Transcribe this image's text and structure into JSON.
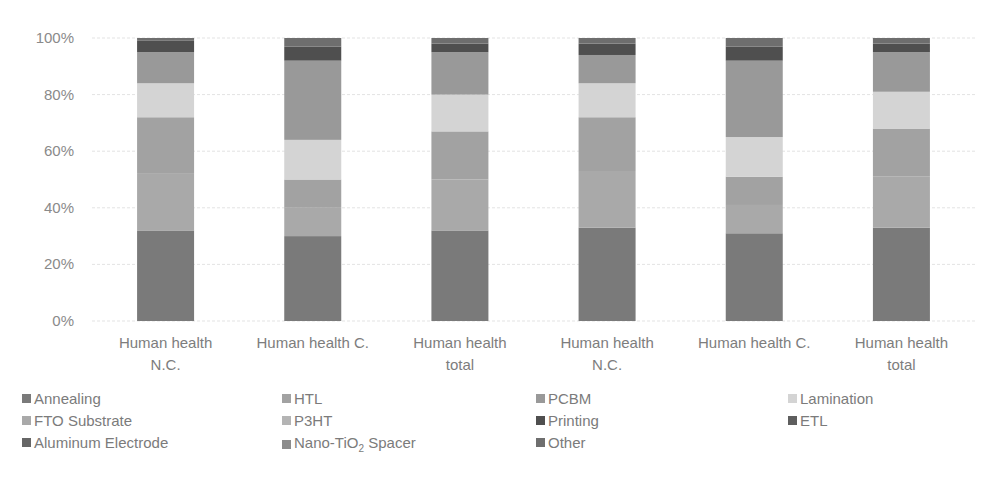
{
  "chart_data": {
    "type": "bar",
    "stacked": "percent",
    "title": "",
    "xlabel": "",
    "ylabel": "",
    "ylim": [
      0,
      100
    ],
    "yticks": [
      "0%",
      "20%",
      "40%",
      "60%",
      "80%",
      "100%"
    ],
    "grid": true,
    "legend_position": "bottom",
    "categories": [
      "Human health N.C.",
      "Human health C.",
      "Human health total",
      "Human health N.C.",
      "Human health C.",
      "Human health total"
    ],
    "category_lines": [
      [
        "Human health",
        "N.C."
      ],
      [
        "Human health C."
      ],
      [
        "Human health",
        "total"
      ],
      [
        "Human health",
        "N.C."
      ],
      [
        "Human health C."
      ],
      [
        "Human health",
        "total"
      ]
    ],
    "series": [
      {
        "name": "Annealing",
        "color": "#7a7a7a",
        "values": [
          32,
          30,
          32,
          33,
          31,
          33
        ]
      },
      {
        "name": "FTO Substrate",
        "color": "#a9a9a9",
        "values": [
          20,
          10,
          18,
          20,
          10,
          18
        ]
      },
      {
        "name": "HTL",
        "color": "#a2a2a2",
        "values": [
          20,
          10,
          17,
          19,
          10,
          17
        ]
      },
      {
        "name": "P3HT",
        "color": "#b4b4b4",
        "values": [
          0,
          0,
          0,
          0,
          0,
          0
        ]
      },
      {
        "name": "Lamination",
        "color": "#d4d4d4",
        "values": [
          12,
          14,
          13,
          12,
          14,
          13
        ]
      },
      {
        "name": "PCBM",
        "color": "#999999",
        "values": [
          11,
          28,
          15,
          10,
          27,
          14
        ]
      },
      {
        "name": "Nano-TiO2 Spacer",
        "color": "#8c8c8c",
        "values": [
          0,
          0,
          0,
          0,
          0,
          0
        ]
      },
      {
        "name": "Printing",
        "color": "#4f4f4f",
        "values": [
          4,
          5,
          3,
          4,
          5,
          3
        ]
      },
      {
        "name": "ETL",
        "color": "#5e5e5e",
        "values": [
          0,
          0,
          0,
          0,
          0,
          0
        ]
      },
      {
        "name": "Aluminum Electrode",
        "color": "#666666",
        "values": [
          0,
          0,
          0,
          0,
          0,
          0
        ]
      },
      {
        "name": "Other",
        "color": "#6e6e6e",
        "values": [
          1,
          3,
          2,
          2,
          3,
          2
        ]
      }
    ]
  },
  "legend": {
    "rows": [
      [
        {
          "label": "Annealing",
          "color": "#7a7a7a"
        },
        {
          "label": "HTL",
          "color": "#a2a2a2"
        },
        {
          "label": "PCBM",
          "color": "#999999"
        },
        {
          "label": "Lamination",
          "color": "#d4d4d4"
        }
      ],
      [
        {
          "label": "FTO Substrate",
          "color": "#a9a9a9"
        },
        {
          "label": "P3HT",
          "color": "#b4b4b4"
        },
        {
          "label": "Printing",
          "color": "#4f4f4f"
        },
        {
          "label": "ETL",
          "color": "#5e5e5e"
        }
      ],
      [
        {
          "label": "Aluminum Electrode",
          "color": "#666666"
        },
        {
          "label": "Nano-TiO",
          "sub": "2",
          "suffix": " Spacer",
          "color": "#8c8c8c"
        },
        {
          "label": "Other",
          "color": "#6e6e6e"
        }
      ]
    ]
  }
}
